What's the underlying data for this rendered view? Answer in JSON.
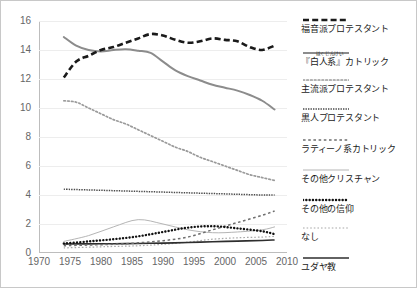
{
  "chart_data": {
    "type": "line",
    "title": "",
    "xlabel": "",
    "ylabel": "",
    "xlim": [
      1970,
      2010
    ],
    "ylim": [
      0,
      16
    ],
    "xticks": [
      1970,
      1975,
      1980,
      1985,
      1990,
      1995,
      2000,
      2005,
      2010
    ],
    "yticks": [
      0,
      2,
      4,
      6,
      8,
      10,
      12,
      14,
      16
    ],
    "grid": "horizontal",
    "legend_position": "right",
    "series": [
      {
        "name": "福音派プロテスタント",
        "style": "thick-dashed",
        "color": "#1a1a1a",
        "x": [
          1974,
          1976,
          1978,
          1980,
          1982,
          1984,
          1986,
          1988,
          1990,
          1992,
          1994,
          1996,
          1998,
          2000,
          2002,
          2004,
          2006,
          2008
        ],
        "y": [
          12.1,
          13.2,
          13.6,
          14.0,
          14.2,
          14.5,
          14.8,
          15.1,
          15.0,
          14.7,
          14.5,
          14.6,
          14.8,
          14.7,
          14.6,
          14.2,
          14.0,
          14.3
        ]
      },
      {
        "name": "『白人系』カトリック",
        "style": "solid-gray",
        "color": "#8c8c8c",
        "x": [
          1974,
          1976,
          1978,
          1980,
          1982,
          1984,
          1986,
          1988,
          1990,
          1992,
          1994,
          1996,
          1998,
          2000,
          2002,
          2004,
          2006,
          2008
        ],
        "y": [
          14.9,
          14.3,
          14.0,
          13.9,
          14.0,
          14.05,
          13.95,
          13.8,
          13.2,
          12.6,
          12.2,
          11.9,
          11.6,
          11.4,
          11.2,
          10.9,
          10.5,
          9.9
        ]
      },
      {
        "name": "主流派プロテスタント",
        "style": "fine-dotted",
        "color": "#9a9a9a",
        "x": [
          1974,
          1976,
          1978,
          1980,
          1982,
          1984,
          1986,
          1988,
          1990,
          1992,
          1994,
          1996,
          1998,
          2000,
          2002,
          2004,
          2006,
          2008
        ],
        "y": [
          10.5,
          10.4,
          10.0,
          9.6,
          9.2,
          8.9,
          8.5,
          8.1,
          7.7,
          7.3,
          7.0,
          6.6,
          6.3,
          6.0,
          5.7,
          5.4,
          5.2,
          5.0
        ]
      },
      {
        "name": "黒人プロテスタント",
        "style": "dash-dot",
        "color": "#4a4a4a",
        "x": [
          1974,
          1978,
          1982,
          1986,
          1990,
          1994,
          1998,
          2002,
          2006,
          2008
        ],
        "y": [
          4.4,
          4.35,
          4.3,
          4.25,
          4.2,
          4.15,
          4.1,
          4.05,
          4.0,
          4.0
        ]
      },
      {
        "name": "ラティーノ系カトリック",
        "style": "dashed-light",
        "color": "#6e6e6e",
        "x": [
          1974,
          1978,
          1982,
          1986,
          1990,
          1994,
          1998,
          2002,
          2006,
          2008
        ],
        "y": [
          0.5,
          0.55,
          0.6,
          0.7,
          0.85,
          1.1,
          1.6,
          2.1,
          2.6,
          2.9
        ]
      },
      {
        "name": "その他クリスチャン",
        "style": "solid-light",
        "color": "#b5b5b5",
        "x": [
          1974,
          1978,
          1982,
          1986,
          1990,
          1994,
          1998,
          2002,
          2006,
          2008
        ],
        "y": [
          0.8,
          1.2,
          1.8,
          2.3,
          2.0,
          1.6,
          1.4,
          1.45,
          1.6,
          1.8
        ]
      },
      {
        "name": "その他の信仰",
        "style": "bold-dotted",
        "color": "#111111",
        "x": [
          1974,
          1978,
          1982,
          1986,
          1990,
          1994,
          1998,
          2002,
          2006,
          2008
        ],
        "y": [
          0.65,
          0.8,
          0.95,
          1.15,
          1.45,
          1.75,
          1.85,
          1.7,
          1.5,
          1.3
        ]
      },
      {
        "name": "なし",
        "style": "fine-dashed",
        "color": "#a8a8a8",
        "x": [
          1974,
          1978,
          1982,
          1986,
          1990,
          1994,
          1998,
          2002,
          2006,
          2008
        ],
        "y": [
          0.35,
          0.4,
          0.45,
          0.5,
          0.6,
          0.75,
          0.95,
          1.05,
          1.1,
          1.15
        ]
      },
      {
        "name": "ユダヤ教",
        "style": "solid-dark",
        "color": "#2e2e2e",
        "x": [
          1974,
          1978,
          1982,
          1986,
          1990,
          1994,
          1998,
          2002,
          2006,
          2008
        ],
        "y": [
          0.62,
          0.63,
          0.64,
          0.66,
          0.68,
          0.72,
          0.78,
          0.82,
          0.86,
          0.9
        ]
      }
    ]
  },
  "legend": {
    "items": [
      {
        "label": "福音派プロテスタント",
        "ruby": ""
      },
      {
        "label": "『白人系』カトリック",
        "ruby": "はくじんけい"
      },
      {
        "label": "主流派プロテスタント",
        "ruby": ""
      },
      {
        "label": "黒人プロテスタント",
        "ruby": ""
      },
      {
        "label": "ラティーノ系カトリック",
        "ruby": ""
      },
      {
        "label": "その他クリスチャン",
        "ruby": ""
      },
      {
        "label": "その他の信仰",
        "ruby": ""
      },
      {
        "label": "なし",
        "ruby": ""
      },
      {
        "label": "ユダヤ教",
        "ruby": ""
      }
    ]
  },
  "axes": {
    "y_labels": [
      "16",
      "14",
      "12",
      "10",
      "8",
      "6",
      "4",
      "2",
      "0"
    ],
    "x_labels": [
      "1970",
      "1975",
      "1980",
      "1985",
      "1990",
      "1995",
      "2000",
      "2005",
      "2010"
    ]
  }
}
